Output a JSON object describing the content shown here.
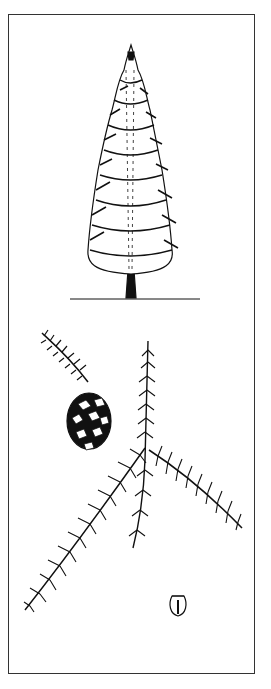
{
  "illustration": {
    "subject": "conifer botanical illustration",
    "panels": [
      "tree-habit",
      "cone-on-branch",
      "foliage-spray",
      "seed"
    ],
    "colors": {
      "ink": "#111111",
      "paper": "#ffffff",
      "frame": "#333333"
    }
  }
}
